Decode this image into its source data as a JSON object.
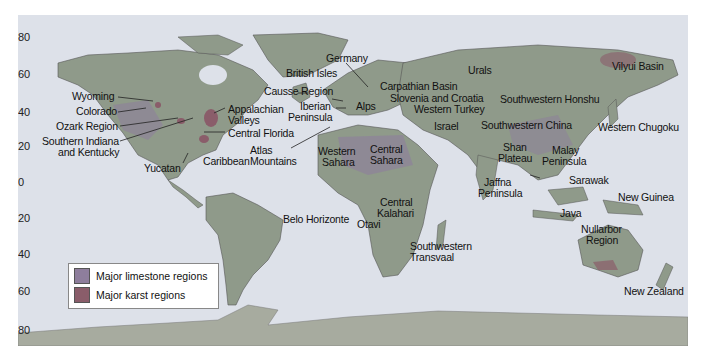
{
  "map": {
    "title": "",
    "colors": {
      "ocean": "#dde1e9",
      "land": "#8f9a8a",
      "land_light": "#a4ad9c",
      "limestone": "#8e7e9c",
      "karst": "#8a5d6a",
      "antarctica": "#a7ab9f"
    },
    "latitude_ticks": [
      {
        "label": "80",
        "y": 37
      },
      {
        "label": "60",
        "y": 74
      },
      {
        "label": "40",
        "y": 112
      },
      {
        "label": "20",
        "y": 146
      },
      {
        "label": "0",
        "y": 182
      },
      {
        "label": "20",
        "y": 218
      },
      {
        "label": "40",
        "y": 254
      },
      {
        "label": "60",
        "y": 291
      },
      {
        "label": "80",
        "y": 330
      }
    ],
    "labels": {
      "wyoming": "Wyoming",
      "colorado": "Colorado",
      "ozark": "Ozark Region",
      "s_indiana_1": "Southern Indiana",
      "s_indiana_2": "and Kentucky",
      "yucatan": "Yucatan",
      "caribbean": "Caribbean",
      "appalachian_1": "Appalachian",
      "appalachian_2": "Valleys",
      "central_florida": "Central Florida",
      "germany": "Germany",
      "british_isles": "British Isles",
      "causse": "Causse Region",
      "iberian_1": "Iberian",
      "iberian_2": "Peninsula",
      "alps": "Alps",
      "atlas_1": "Atlas",
      "atlas_2": "Mountains",
      "w_sahara_1": "Western",
      "w_sahara_2": "Sahara",
      "c_sahara_1": "Central",
      "c_sahara_2": "Sahara",
      "carpathian": "Carpathian Basin",
      "slovenia": "Slovenia and Croatia",
      "w_turkey": "Western Turkey",
      "israel": "Israel",
      "urals": "Urals",
      "vilyui": "Vilyui Basin",
      "sw_honshu": "Southwestern Honshu",
      "sw_china": "Southwestern China",
      "w_chugoku": "Western Chugoku",
      "shan_1": "Shan",
      "shan_2": "Plateau",
      "malay_1": "Malay",
      "malay_2": "Peninsula",
      "jaffna_1": "Jaffna",
      "jaffna_2": "Peninsula",
      "sarawak": "Sarawak",
      "new_guinea": "New Guinea",
      "java": "Java",
      "nullarbor_1": "Nullarbor",
      "nullarbor_2": "Region",
      "new_zealand": "New Zealand",
      "belo_horizonte": "Belo Horizonte",
      "c_kalahari_1": "Central",
      "c_kalahari_2": "Kalahari",
      "otavi": "Otavi",
      "sw_transvaal_1": "Southwestern",
      "sw_transvaal_2": "Transvaal"
    },
    "legend": {
      "items": [
        {
          "label": "Major limestone regions",
          "color": "#8e7e9c"
        },
        {
          "label": "Major karst regions",
          "color": "#8a5d6a"
        }
      ]
    }
  }
}
